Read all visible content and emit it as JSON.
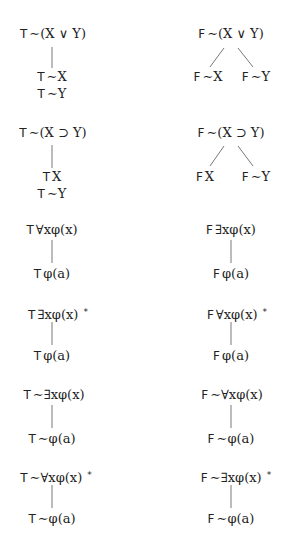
{
  "rules": [
    {
      "id": "T-neg-or",
      "root": {
        "sign": "T",
        "formula": "∼(X ∨ Y)",
        "starred": false
      },
      "branching": false,
      "children": [
        {
          "sign": "T",
          "formula": "∼X"
        },
        {
          "sign": "T",
          "formula": "∼Y"
        }
      ]
    },
    {
      "id": "F-neg-or",
      "root": {
        "sign": "F",
        "formula": "∼(X ∨ Y)",
        "starred": false
      },
      "branching": true,
      "children": [
        {
          "sign": "F",
          "formula": "∼X"
        },
        {
          "sign": "F",
          "formula": "∼Y"
        }
      ]
    },
    {
      "id": "T-neg-imp",
      "root": {
        "sign": "T",
        "formula": "∼(X ⊃ Y)",
        "starred": false
      },
      "branching": false,
      "children": [
        {
          "sign": "T",
          "formula": "X"
        },
        {
          "sign": "T",
          "formula": "∼Y"
        }
      ]
    },
    {
      "id": "F-neg-imp",
      "root": {
        "sign": "F",
        "formula": "∼(X ⊃ Y)",
        "starred": false
      },
      "branching": true,
      "children": [
        {
          "sign": "F",
          "formula": "X"
        },
        {
          "sign": "F",
          "formula": "∼Y"
        }
      ]
    },
    {
      "id": "T-forall",
      "root": {
        "sign": "T",
        "formula": "∀xφ(x)",
        "starred": false
      },
      "branching": false,
      "children": [
        {
          "sign": "T",
          "formula": "φ(a)"
        }
      ]
    },
    {
      "id": "F-exists",
      "root": {
        "sign": "F",
        "formula": "∃xφ(x)",
        "starred": false
      },
      "branching": false,
      "children": [
        {
          "sign": "F",
          "formula": "φ(a)"
        }
      ]
    },
    {
      "id": "T-exists",
      "root": {
        "sign": "T",
        "formula": "∃xφ(x)",
        "starred": true,
        "star": "*"
      },
      "branching": false,
      "children": [
        {
          "sign": "T",
          "formula": "φ(a)"
        }
      ]
    },
    {
      "id": "F-forall",
      "root": {
        "sign": "F",
        "formula": "∀xφ(x)",
        "starred": true,
        "star": "*"
      },
      "branching": false,
      "children": [
        {
          "sign": "F",
          "formula": "φ(a)"
        }
      ]
    },
    {
      "id": "T-neg-exists",
      "root": {
        "sign": "T",
        "formula": "∼∃xφ(x)",
        "starred": false
      },
      "branching": false,
      "children": [
        {
          "sign": "T",
          "formula": "∼φ(a)"
        }
      ]
    },
    {
      "id": "F-neg-forall",
      "root": {
        "sign": "F",
        "formula": "∼∀xφ(x)",
        "starred": false
      },
      "branching": false,
      "children": [
        {
          "sign": "F",
          "formula": "∼φ(a)"
        }
      ]
    },
    {
      "id": "T-neg-forall",
      "root": {
        "sign": "T",
        "formula": "∼∀xφ(x)",
        "starred": true,
        "star": "*"
      },
      "branching": false,
      "children": [
        {
          "sign": "T",
          "formula": "∼φ(a)"
        }
      ]
    },
    {
      "id": "F-neg-exists",
      "root": {
        "sign": "F",
        "formula": "∼∃xφ(x)",
        "starred": true,
        "star": "*"
      },
      "branching": false,
      "children": [
        {
          "sign": "F",
          "formula": "∼φ(a)"
        }
      ]
    }
  ]
}
